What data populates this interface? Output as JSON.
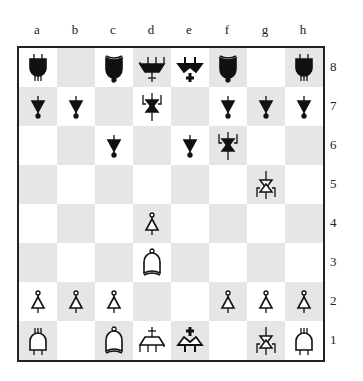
{
  "files": [
    "a",
    "b",
    "c",
    "d",
    "e",
    "f",
    "g",
    "h"
  ],
  "ranks": [
    "8",
    "7",
    "6",
    "5",
    "4",
    "3",
    "2",
    "1"
  ],
  "colors": {
    "light": "#ffffff",
    "dark": "#e6e6e6",
    "border": "#222222"
  },
  "pieces": {
    "a8": {
      "color": "black",
      "type": "rook"
    },
    "c8": {
      "color": "black",
      "type": "bishop"
    },
    "d8": {
      "color": "black",
      "type": "queen"
    },
    "e8": {
      "color": "black",
      "type": "king"
    },
    "f8": {
      "color": "black",
      "type": "bishop"
    },
    "h8": {
      "color": "black",
      "type": "rook"
    },
    "a7": {
      "color": "black",
      "type": "pawn"
    },
    "b7": {
      "color": "black",
      "type": "pawn"
    },
    "d7": {
      "color": "black",
      "type": "knight"
    },
    "f7": {
      "color": "black",
      "type": "pawn"
    },
    "g7": {
      "color": "black",
      "type": "pawn"
    },
    "h7": {
      "color": "black",
      "type": "pawn"
    },
    "c6": {
      "color": "black",
      "type": "pawn"
    },
    "e6": {
      "color": "black",
      "type": "pawn"
    },
    "f6": {
      "color": "black",
      "type": "knight"
    },
    "g5": {
      "color": "white",
      "type": "knight"
    },
    "d4": {
      "color": "white",
      "type": "pawn"
    },
    "d3": {
      "color": "white",
      "type": "bishop"
    },
    "a2": {
      "color": "white",
      "type": "pawn"
    },
    "b2": {
      "color": "white",
      "type": "pawn"
    },
    "c2": {
      "color": "white",
      "type": "pawn"
    },
    "f2": {
      "color": "white",
      "type": "pawn"
    },
    "g2": {
      "color": "white",
      "type": "pawn"
    },
    "h2": {
      "color": "white",
      "type": "pawn"
    },
    "a1": {
      "color": "white",
      "type": "rook"
    },
    "c1": {
      "color": "white",
      "type": "bishop"
    },
    "d1": {
      "color": "white",
      "type": "queen"
    },
    "e1": {
      "color": "white",
      "type": "king"
    },
    "g1": {
      "color": "white",
      "type": "knight"
    },
    "h1": {
      "color": "white",
      "type": "rook"
    }
  }
}
